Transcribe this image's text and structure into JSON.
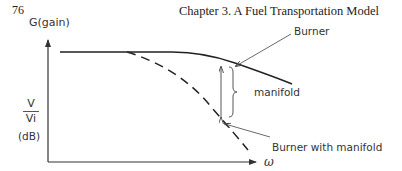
{
  "header": {
    "page_number": "76",
    "chapter_title": "Chapter 3. A Fuel Transportation Model"
  },
  "diagram": {
    "y_axis_label": "G(gain)",
    "y_axis_ratio": {
      "numerator": "V",
      "denominator": "Vi"
    },
    "y_axis_unit": "(dB)",
    "x_axis_label": "ω",
    "curves": [
      {
        "name": "Burner",
        "style": "solid"
      },
      {
        "name": "Burner with manifold",
        "style": "dashed"
      }
    ],
    "annotations": {
      "burner_label": "Burner",
      "gap_label": "manifold",
      "burner_with_manifold_label": "Burner with manifold"
    },
    "colors": {
      "line": "#222222",
      "text": "#333333"
    }
  }
}
